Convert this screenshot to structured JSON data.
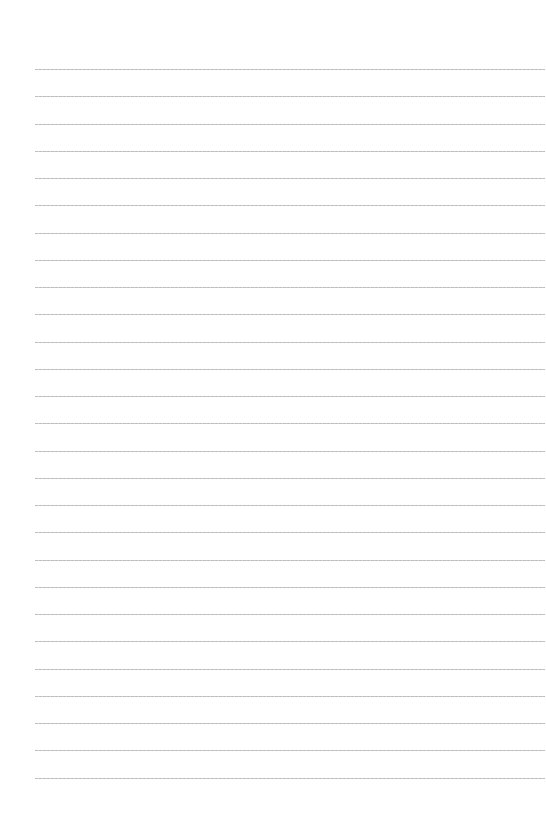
{
  "page": {
    "type": "blank lined paper",
    "background_color": "#ffffff",
    "rule_color": "#c4c4c4",
    "rule_count": 27,
    "first_rule_y": 69,
    "rule_spacing": 27.25,
    "rule_left": 35,
    "rule_right": 545
  }
}
